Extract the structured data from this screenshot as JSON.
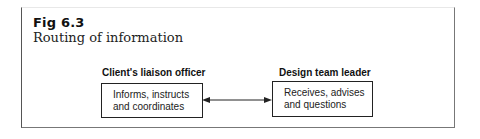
{
  "figure": {
    "number": "Fig 6.3",
    "title": "Routing of information"
  },
  "nodes": [
    {
      "role": "Client's liaison officer",
      "lines": [
        "Informs, instructs",
        "and coordinates"
      ]
    },
    {
      "role": "Design team leader",
      "lines": [
        "Receives, advises",
        "and questions"
      ]
    }
  ],
  "connector": {
    "type": "bidirectional-arrow",
    "from": "Client's liaison officer",
    "to": "Design team leader"
  },
  "colors": {
    "line": "#222222",
    "background": "#ffffff"
  }
}
